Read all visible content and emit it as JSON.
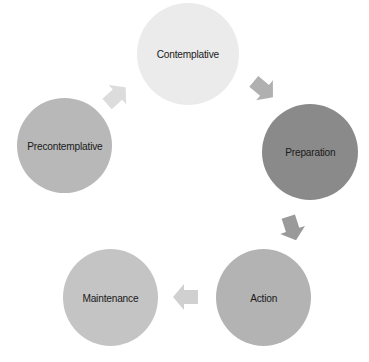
{
  "diagram": {
    "type": "cycle",
    "nodes": [
      {
        "id": "contemplative",
        "label": "Contemplative",
        "color": "#ebebeb",
        "cx": 188,
        "cy": 54,
        "r": 51
      },
      {
        "id": "preparation",
        "label": "Preparation",
        "color": "#8a8a8a",
        "cx": 310,
        "cy": 152,
        "r": 48
      },
      {
        "id": "action",
        "label": "Action",
        "color": "#b3b3b3",
        "cx": 263,
        "cy": 297,
        "r": 48
      },
      {
        "id": "maintenance",
        "label": "Maintenance",
        "color": "#c4c4c4",
        "cx": 110,
        "cy": 297,
        "r": 48
      },
      {
        "id": "precontemplative",
        "label": "Precontemplative",
        "color": "#b8b8b8",
        "cx": 64,
        "cy": 145,
        "r": 48
      }
    ],
    "edges": [
      {
        "from": "precontemplative",
        "to": "contemplative",
        "direction": "up-right",
        "color": "#dcdcdc"
      },
      {
        "from": "contemplative",
        "to": "preparation",
        "direction": "down-right",
        "color": "#b0b0b0"
      },
      {
        "from": "preparation",
        "to": "action",
        "direction": "down",
        "color": "#9a9a9a"
      },
      {
        "from": "action",
        "to": "maintenance",
        "direction": "left",
        "color": "#d0d0d0"
      }
    ]
  }
}
